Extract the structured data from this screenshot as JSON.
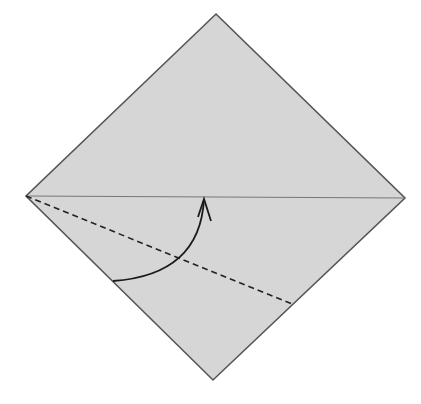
{
  "diagram": {
    "type": "origami-fold-step",
    "colors": {
      "paper_fill": "#d6d6d6",
      "edge_stroke": "#555555",
      "crease_stroke": "#777777",
      "fold_line_stroke": "#222222",
      "arrow_stroke": "#1a1a1a",
      "background": "#ffffff"
    },
    "paper": {
      "shape": "diamond",
      "vertices": {
        "top": [
          216,
          14
        ],
        "right": [
          405,
          198
        ],
        "bottom": [
          213,
          380
        ],
        "left": [
          26,
          196
        ]
      }
    },
    "crease": {
      "style": "solid-thin",
      "from": [
        26,
        196
      ],
      "to": [
        405,
        198
      ]
    },
    "valley_fold_line": {
      "style": "dashed",
      "from": [
        26,
        196
      ],
      "to": [
        292,
        304
      ]
    },
    "fold_arrow": {
      "style": "curved",
      "start": [
        113,
        281
      ],
      "control": [
        200,
        275
      ],
      "end": [
        204,
        199
      ],
      "head": "open-v"
    }
  }
}
